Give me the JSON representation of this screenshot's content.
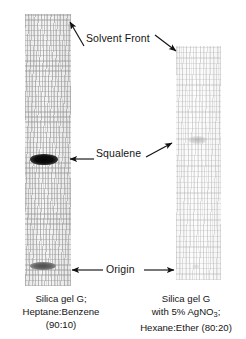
{
  "figure": {
    "type": "thin-layer-chromatography-plates",
    "annotations": [
      {
        "id": "solvent-front",
        "label": "Solvent Front"
      },
      {
        "id": "squalene",
        "label": "Squalene"
      },
      {
        "id": "origin",
        "label": "Origin"
      }
    ],
    "plates": [
      {
        "id": "left-plate",
        "caption_lines": [
          "Silica gel G;",
          "Heptane:Benzene",
          "(90:10)"
        ],
        "stationary_phase": "Silica gel G;",
        "mobile_phase": "Heptane:Benzene",
        "ratio": "(90:10)",
        "spots": [
          {
            "id": "squalene-band",
            "intensity": "dark",
            "position": "mid-plate"
          },
          {
            "id": "origin-band",
            "intensity": "medium-gray",
            "position": "bottom"
          }
        ]
      },
      {
        "id": "right-plate",
        "caption_lines": [
          "Silica gel G",
          "with 5% AgNO3;",
          "Hexane:Ether (80:20)"
        ],
        "stationary_phase_line1": "Silica gel G",
        "stationary_phase_line2_pre": "with 5% AgNO",
        "stationary_phase_line2_sub": "3",
        "stationary_phase_line2_post": ";",
        "mobile_phase": "Hexane:Ether (80:20)",
        "spots": [
          {
            "id": "squalene-spot",
            "intensity": "faint",
            "position": "upper-mid-plate"
          }
        ]
      }
    ],
    "colors": {
      "background": "#ffffff",
      "text": "#151515",
      "plate_left_fill": "#f0f0f0",
      "plate_right_fill": "#fbfbfb",
      "dark_band": "#0a0a0a",
      "gray_band": "#646464",
      "faint_band": "#b4b4b4",
      "arrow": "#121212"
    }
  }
}
